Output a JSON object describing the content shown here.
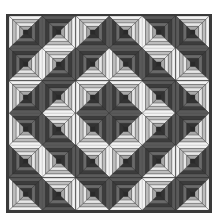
{
  "quilt": {
    "pattern": "log-cabin",
    "rows": 6,
    "cols": 6,
    "rings": 4,
    "layout": [
      [
        "TL",
        "BR",
        "TL",
        "TR",
        "BL",
        "TR"
      ],
      [
        "BR",
        "TL",
        "BR",
        "BL",
        "TR",
        "BL"
      ],
      [
        "TL",
        "BR",
        "TL",
        "TR",
        "BL",
        "TR"
      ],
      [
        "BL",
        "TR",
        "BL",
        "BR",
        "TL",
        "BR"
      ],
      [
        "TR",
        "BL",
        "TR",
        "TL",
        "BR",
        "TL"
      ],
      [
        "BL",
        "TR",
        "BL",
        "BR",
        "TL",
        "BR"
      ]
    ],
    "colors": {
      "border": "#3a3a3a",
      "center": "#2a2a2a",
      "light": [
        "#f2f2f2",
        "#bdbdbd",
        "#e6e6e6",
        "#a8a8a8"
      ],
      "dark": [
        "#5a5a5a",
        "#3c3c3c",
        "#6a6a6a",
        "#333333"
      ],
      "seam": "#2e2e2e"
    }
  }
}
